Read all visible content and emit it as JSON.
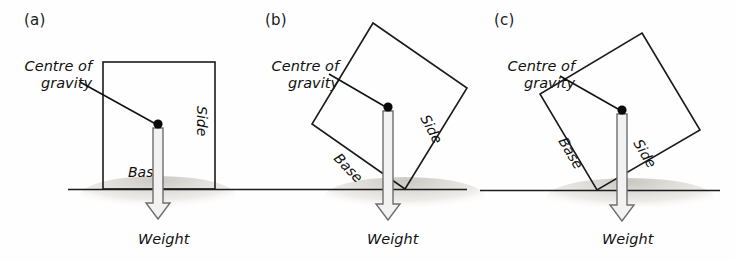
{
  "figure": {
    "ground_color": "#1b1b1b",
    "box_fill_color": "#d9d6d1",
    "arrow_fill_color": "#f2f2f2",
    "arrow_stroke_color": "#6e6e6e",
    "dot_color": "#0a0a0a"
  },
  "panels": [
    {
      "id": "a",
      "label": "(a)",
      "cog_label_line1": "Centre of",
      "cog_label_line2": "gravity",
      "base_label": "Base",
      "side_label": "Side",
      "weight_label": "Weight",
      "tilt_degrees": 0,
      "state": "upright - weight line falls inside the base"
    },
    {
      "id": "b",
      "label": "(b)",
      "cog_label_line1": "Centre of",
      "cog_label_line2": "gravity",
      "base_label": "Base",
      "side_label": "Side",
      "weight_label": "Weight",
      "tilt_degrees": 28,
      "state": "tilted - weight line still falls within the base corner"
    },
    {
      "id": "c",
      "label": "(c)",
      "cog_label_line1": "Centre of",
      "cog_label_line2": "gravity",
      "base_label": "Base",
      "side_label": "Side",
      "weight_label": "Weight",
      "tilt_degrees": 38,
      "state": "tilted further - weight line falls outside the base, box topples"
    }
  ]
}
